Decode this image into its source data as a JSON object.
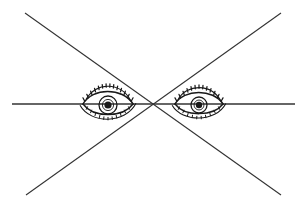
{
  "figure": {
    "title": "Two eyes with converging sight lines",
    "caption": "Line drawing of a pair of eyes with three straight lines meeting at a single convergence point between them",
    "width": 306,
    "height": 208,
    "background_color": "#ffffff",
    "ink_color": "#1a1a1a",
    "line_color": "#333333"
  },
  "convergence_point": {
    "label": "convergence-point",
    "x": 153,
    "y": 104
  },
  "lines": [
    {
      "name": "diagonal-top-left-to-bottom-right",
      "x1": 25,
      "y1": 13,
      "x2": 281,
      "y2": 195,
      "stroke_width": 1.1,
      "color": "#333333"
    },
    {
      "name": "diagonal-bottom-left-to-top-right",
      "x1": 26,
      "y1": 195,
      "x2": 281,
      "y2": 13,
      "stroke_width": 1.1,
      "color": "#333333"
    },
    {
      "name": "horizontal-eye-level-line",
      "x1": 12,
      "y1": 104,
      "x2": 295,
      "y2": 104,
      "stroke_width": 1.6,
      "color": "#333333"
    }
  ],
  "eyes": [
    {
      "name": "left-eye",
      "side": "left",
      "center_x": 108,
      "center_y": 104,
      "half_width": 25,
      "half_height": 13,
      "iris_radius": 9,
      "pupil_radius": 3.6,
      "lash_count": 14,
      "lower_lash_count": 11,
      "description": "open eye, iris and pupil visible, upper lid with dense lashes"
    },
    {
      "name": "right-eye",
      "side": "right",
      "center_x": 199,
      "center_y": 104,
      "half_width": 24,
      "half_height": 12,
      "iris_radius": 8,
      "pupil_radius": 3.2,
      "lash_count": 13,
      "lower_lash_count": 10,
      "description": "partially lidded eye, iris mostly covered by upper lid"
    }
  ]
}
